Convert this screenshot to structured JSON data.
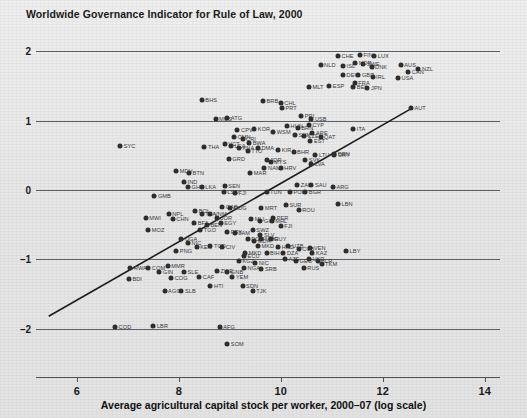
{
  "chart_data": {
    "type": "scatter",
    "title": "Worldwide Governance Indicator for Rule of Law, 2000",
    "xlabel": "Average agricultural capital stock per worker, 2000–07 (log scale)",
    "ylabel": "",
    "xlim": [
      5.2,
      14.3
    ],
    "ylim": [
      -2.45,
      2.25
    ],
    "xticks": [
      6,
      8,
      10,
      12,
      14
    ],
    "yticks": [
      2,
      1,
      0,
      -1,
      -2
    ],
    "grid": "horizontal",
    "legend": "none",
    "trendline": {
      "x0": 5.45,
      "y0": -1.82,
      "x1": 12.55,
      "y1": 1.17
    },
    "points": [
      {
        "label": "CHE",
        "x": 11.12,
        "y": 1.93
      },
      {
        "label": "FIN",
        "x": 11.55,
        "y": 1.95
      },
      {
        "label": "LUX",
        "x": 11.83,
        "y": 1.94
      },
      {
        "label": "NOR",
        "x": 11.46,
        "y": 1.83
      },
      {
        "label": "SWE",
        "x": 11.62,
        "y": 1.82
      },
      {
        "label": "DNK",
        "x": 11.78,
        "y": 1.77
      },
      {
        "label": "ISL",
        "x": 11.22,
        "y": 1.79
      },
      {
        "label": "NLD",
        "x": 10.78,
        "y": 1.8
      },
      {
        "label": "AUS",
        "x": 12.35,
        "y": 1.8
      },
      {
        "label": "NZL",
        "x": 12.7,
        "y": 1.74
      },
      {
        "label": "CAN",
        "x": 12.5,
        "y": 1.7
      },
      {
        "label": "DEU",
        "x": 11.22,
        "y": 1.66
      },
      {
        "label": "GBR",
        "x": 11.52,
        "y": 1.66
      },
      {
        "label": "IRL",
        "x": 11.8,
        "y": 1.63
      },
      {
        "label": "USA",
        "x": 12.3,
        "y": 1.62
      },
      {
        "label": "FRA",
        "x": 11.45,
        "y": 1.55
      },
      {
        "label": "MLT",
        "x": 10.55,
        "y": 1.49
      },
      {
        "label": "ESP",
        "x": 10.95,
        "y": 1.5
      },
      {
        "label": "BEL",
        "x": 11.42,
        "y": 1.48
      },
      {
        "label": "JPN",
        "x": 11.7,
        "y": 1.47
      },
      {
        "label": "BHS",
        "x": 8.45,
        "y": 1.3
      },
      {
        "label": "BRB",
        "x": 9.65,
        "y": 1.29
      },
      {
        "label": "CHL",
        "x": 10.0,
        "y": 1.25
      },
      {
        "label": "PRT",
        "x": 10.02,
        "y": 1.19
      },
      {
        "label": "AUT",
        "x": 12.55,
        "y": 1.18
      },
      {
        "label": "MUS",
        "x": 8.72,
        "y": 1.03
      },
      {
        "label": "ATG",
        "x": 8.95,
        "y": 1.04
      },
      {
        "label": "PRI",
        "x": 10.4,
        "y": 1.07
      },
      {
        "label": "USB",
        "x": 10.6,
        "y": 1.02
      },
      {
        "label": "HUN",
        "x": 10.12,
        "y": 0.93
      },
      {
        "label": "CYP",
        "x": 10.55,
        "y": 0.94
      },
      {
        "label": "BRN",
        "x": 10.33,
        "y": 0.9
      },
      {
        "label": "ITA",
        "x": 11.42,
        "y": 0.88
      },
      {
        "label": "KOR",
        "x": 9.48,
        "y": 0.88
      },
      {
        "label": "CPV",
        "x": 9.15,
        "y": 0.86
      },
      {
        "label": "WSM",
        "x": 9.85,
        "y": 0.84
      },
      {
        "label": "ARE",
        "x": 10.62,
        "y": 0.82
      },
      {
        "label": "SVN",
        "x": 10.28,
        "y": 0.79
      },
      {
        "label": "CZE",
        "x": 10.45,
        "y": 0.78
      },
      {
        "label": "QAT",
        "x": 10.78,
        "y": 0.76
      },
      {
        "label": "OMN",
        "x": 9.08,
        "y": 0.77
      },
      {
        "label": "CRI",
        "x": 9.25,
        "y": 0.74
      },
      {
        "label": "EST",
        "x": 10.58,
        "y": 0.71
      },
      {
        "label": "BWA",
        "x": 9.38,
        "y": 0.68
      },
      {
        "label": "SYC",
        "x": 6.85,
        "y": 0.64
      },
      {
        "label": "THA",
        "x": 8.5,
        "y": 0.62
      },
      {
        "label": "VCT",
        "x": 8.9,
        "y": 0.66
      },
      {
        "label": "LCA",
        "x": 9.02,
        "y": 0.63
      },
      {
        "label": "KNA",
        "x": 9.18,
        "y": 0.6
      },
      {
        "label": "TTO",
        "x": 9.35,
        "y": 0.56
      },
      {
        "label": "DMA",
        "x": 9.55,
        "y": 0.61
      },
      {
        "label": "KIR",
        "x": 9.95,
        "y": 0.58
      },
      {
        "label": "BHR",
        "x": 10.25,
        "y": 0.55
      },
      {
        "label": "BRN2",
        "x": 11.05,
        "y": 0.52
      },
      {
        "label": "LTU",
        "x": 10.68,
        "y": 0.5
      },
      {
        "label": "URY",
        "x": 11.05,
        "y": 0.5
      },
      {
        "label": "GRD",
        "x": 8.98,
        "y": 0.45
      },
      {
        "label": "JOR",
        "x": 9.72,
        "y": 0.44
      },
      {
        "label": "MYS",
        "x": 9.8,
        "y": 0.4
      },
      {
        "label": "SVK",
        "x": 10.48,
        "y": 0.44
      },
      {
        "label": "LVA",
        "x": 10.6,
        "y": 0.38
      },
      {
        "label": "BTN",
        "x": 8.2,
        "y": 0.25
      },
      {
        "label": "MDV",
        "x": 7.95,
        "y": 0.28
      },
      {
        "label": "NAM",
        "x": 9.68,
        "y": 0.32
      },
      {
        "label": "HRV",
        "x": 10.0,
        "y": 0.32
      },
      {
        "label": "MAR",
        "x": 9.4,
        "y": 0.24
      },
      {
        "label": "IND",
        "x": 8.1,
        "y": 0.12
      },
      {
        "label": "GHA",
        "x": 8.18,
        "y": 0.05
      },
      {
        "label": "LKA",
        "x": 8.45,
        "y": 0.04
      },
      {
        "label": "SEN",
        "x": 8.9,
        "y": 0.06
      },
      {
        "label": "LSO",
        "x": 8.88,
        "y": -0.02
      },
      {
        "label": "ZAF",
        "x": 10.32,
        "y": 0.08
      },
      {
        "label": "SAU",
        "x": 10.6,
        "y": 0.08
      },
      {
        "label": "ARG",
        "x": 11.02,
        "y": 0.05
      },
      {
        "label": "GMB",
        "x": 7.52,
        "y": -0.08
      },
      {
        "label": "TUN",
        "x": 9.72,
        "y": -0.02
      },
      {
        "label": "FJI2",
        "x": 9.1,
        "y": -0.04
      },
      {
        "label": "POL",
        "x": 10.18,
        "y": -0.03
      },
      {
        "label": "BGR",
        "x": 10.48,
        "y": -0.03
      },
      {
        "label": "LBN",
        "x": 11.12,
        "y": -0.2
      },
      {
        "label": "GAB",
        "x": 8.85,
        "y": -0.25
      },
      {
        "label": "BOL",
        "x": 8.32,
        "y": -0.3
      },
      {
        "label": "MDG",
        "x": 9.0,
        "y": -0.26
      },
      {
        "label": "MRT",
        "x": 9.62,
        "y": -0.26
      },
      {
        "label": "SUR",
        "x": 10.1,
        "y": -0.22
      },
      {
        "label": "ROU",
        "x": 10.35,
        "y": -0.28
      },
      {
        "label": "NPL",
        "x": 7.8,
        "y": -0.34
      },
      {
        "label": "TZA",
        "x": 8.45,
        "y": -0.34
      },
      {
        "label": "VNM",
        "x": 8.62,
        "y": -0.34
      },
      {
        "label": "MWI",
        "x": 7.35,
        "y": -0.4
      },
      {
        "label": "CHN",
        "x": 7.88,
        "y": -0.42
      },
      {
        "label": "JOR2",
        "x": 8.75,
        "y": -0.4
      },
      {
        "label": "PER",
        "x": 9.85,
        "y": -0.4
      },
      {
        "label": "MLI",
        "x": 9.42,
        "y": -0.42
      },
      {
        "label": "GIN2",
        "x": 9.6,
        "y": -0.44
      },
      {
        "label": "MHL",
        "x": 9.82,
        "y": -0.44
      },
      {
        "label": "BFA",
        "x": 8.3,
        "y": -0.48
      },
      {
        "label": "BEN",
        "x": 8.55,
        "y": -0.5
      },
      {
        "label": "EGY",
        "x": 8.82,
        "y": -0.48
      },
      {
        "label": "FJI",
        "x": 10.0,
        "y": -0.52
      },
      {
        "label": "MOZ",
        "x": 7.4,
        "y": -0.58
      },
      {
        "label": "TGO",
        "x": 8.42,
        "y": -0.58
      },
      {
        "label": "PRK",
        "x": 8.95,
        "y": -0.6
      },
      {
        "label": "SWZ",
        "x": 9.45,
        "y": -0.58
      },
      {
        "label": "SLV",
        "x": 9.6,
        "y": -0.64
      },
      {
        "label": "JAM",
        "x": 9.1,
        "y": -0.62
      },
      {
        "label": "DOM",
        "x": 9.35,
        "y": -0.7
      },
      {
        "label": "MMR2",
        "x": 9.62,
        "y": -0.7
      },
      {
        "label": "GUY",
        "x": 9.8,
        "y": -0.7
      },
      {
        "label": "UGA",
        "x": 8.05,
        "y": -0.7
      },
      {
        "label": "NIC",
        "x": 8.18,
        "y": -0.76
      },
      {
        "label": "MDA",
        "x": 9.48,
        "y": -0.74
      },
      {
        "label": "KEN",
        "x": 8.35,
        "y": -0.82
      },
      {
        "label": "TCD",
        "x": 8.62,
        "y": -0.8
      },
      {
        "label": "CIV",
        "x": 8.85,
        "y": -0.82
      },
      {
        "label": "MKD2",
        "x": 9.55,
        "y": -0.8
      },
      {
        "label": "HND",
        "x": 9.95,
        "y": -0.82
      },
      {
        "label": "UZB",
        "x": 10.15,
        "y": -0.8
      },
      {
        "label": "PNG",
        "x": 7.95,
        "y": -0.88
      },
      {
        "label": "MKD",
        "x": 9.3,
        "y": -0.9
      },
      {
        "label": "ECU",
        "x": 9.28,
        "y": -0.95
      },
      {
        "label": "BIH",
        "x": 9.72,
        "y": -0.9
      },
      {
        "label": "DZA",
        "x": 10.05,
        "y": -0.9
      },
      {
        "label": "CUB",
        "x": 10.35,
        "y": -0.85
      },
      {
        "label": "VEN",
        "x": 10.58,
        "y": -0.83
      },
      {
        "label": "KAZ",
        "x": 10.62,
        "y": -0.9
      },
      {
        "label": "LBY",
        "x": 11.28,
        "y": -0.88
      },
      {
        "label": "KGZ",
        "x": 9.18,
        "y": -1.02
      },
      {
        "label": "NIC2",
        "x": 9.5,
        "y": -1.05
      },
      {
        "label": "AZE",
        "x": 10.08,
        "y": -1.0
      },
      {
        "label": "GEO",
        "x": 10.3,
        "y": -1.02
      },
      {
        "label": "UKR",
        "x": 10.55,
        "y": -1.0
      },
      {
        "label": "BLR",
        "x": 10.72,
        "y": -1.02
      },
      {
        "label": "TKM",
        "x": 10.8,
        "y": -1.06
      },
      {
        "label": "RWA",
        "x": 7.05,
        "y": -1.12
      },
      {
        "label": "COM",
        "x": 7.4,
        "y": -1.12
      },
      {
        "label": "MMR",
        "x": 7.78,
        "y": -1.1
      },
      {
        "label": "GIN",
        "x": 7.62,
        "y": -1.18
      },
      {
        "label": "SLE",
        "x": 8.1,
        "y": -1.18
      },
      {
        "label": "ZWE",
        "x": 8.75,
        "y": -1.16
      },
      {
        "label": "GNB",
        "x": 8.95,
        "y": -1.18
      },
      {
        "label": "NGA",
        "x": 9.28,
        "y": -1.12
      },
      {
        "label": "SRB",
        "x": 9.62,
        "y": -1.14
      },
      {
        "label": "RUS",
        "x": 10.45,
        "y": -1.12
      },
      {
        "label": "BDI",
        "x": 7.02,
        "y": -1.28
      },
      {
        "label": "COG",
        "x": 7.85,
        "y": -1.26
      },
      {
        "label": "CAF",
        "x": 8.4,
        "y": -1.25
      },
      {
        "label": "YEM",
        "x": 9.05,
        "y": -1.25
      },
      {
        "label": "HTI",
        "x": 8.62,
        "y": -1.38
      },
      {
        "label": "SDN",
        "x": 9.25,
        "y": -1.38
      },
      {
        "label": "TJK",
        "x": 9.45,
        "y": -1.45
      },
      {
        "label": "AGO",
        "x": 7.72,
        "y": -1.46
      },
      {
        "label": "SLB",
        "x": 8.05,
        "y": -1.46
      },
      {
        "label": "COD",
        "x": 6.75,
        "y": -1.98
      },
      {
        "label": "LBR",
        "x": 7.5,
        "y": -1.96
      },
      {
        "label": "AFG",
        "x": 8.8,
        "y": -1.98
      },
      {
        "label": "SOM",
        "x": 8.95,
        "y": -2.22
      }
    ]
  }
}
